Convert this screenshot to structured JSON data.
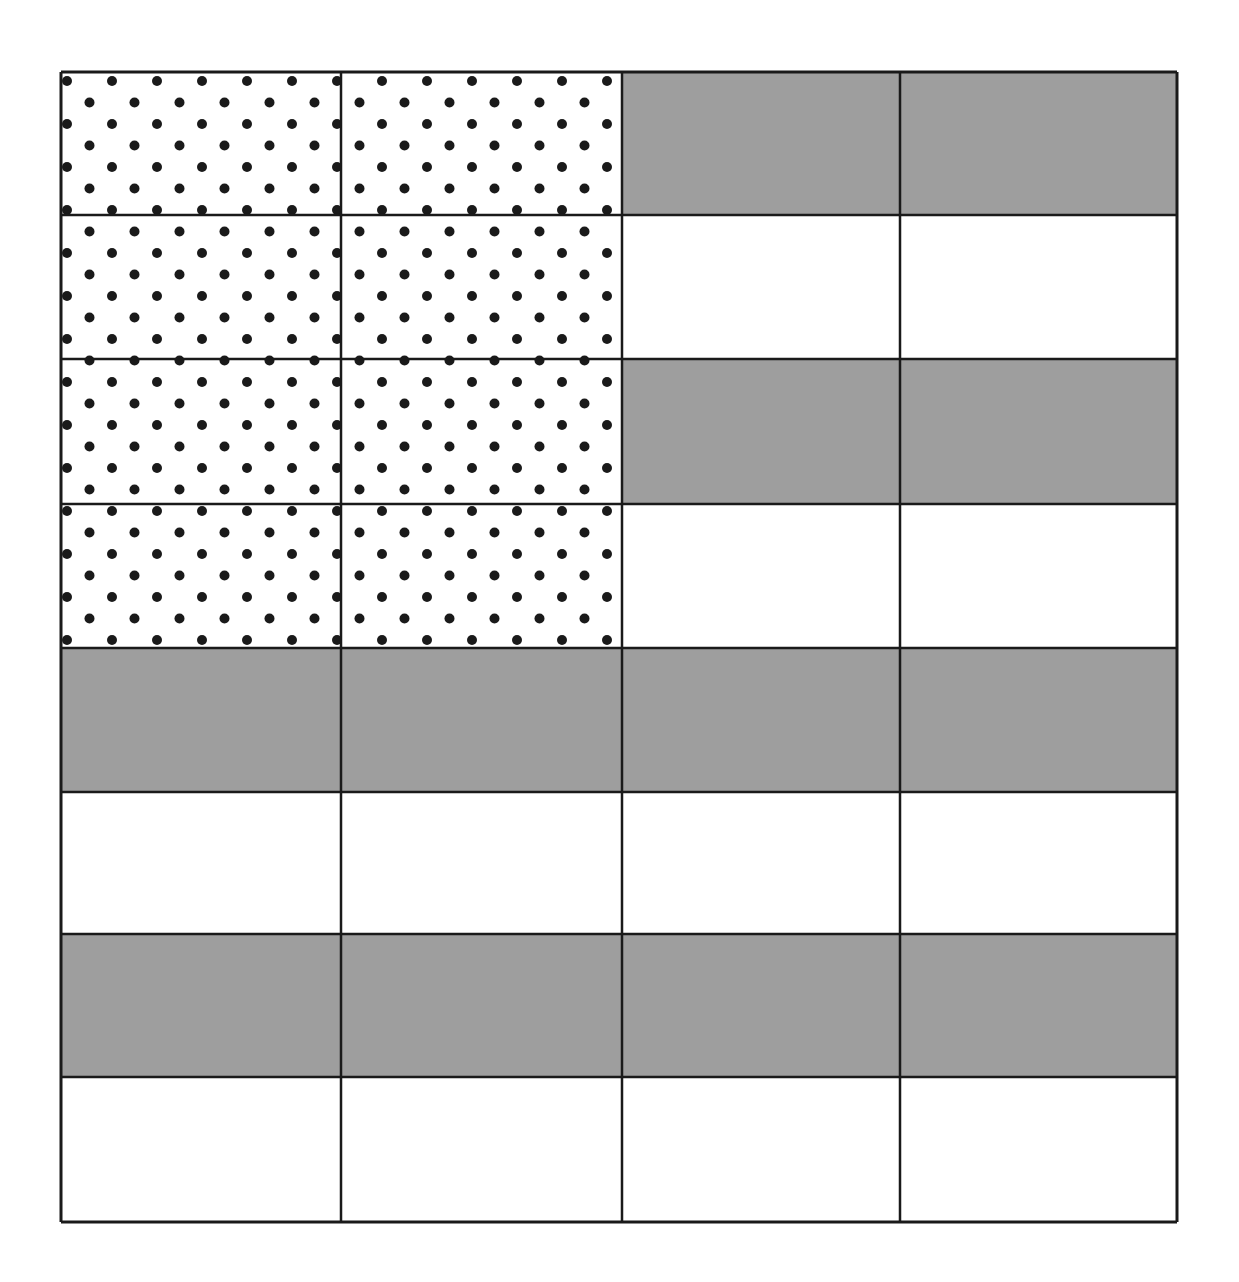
{
  "diagram": {
    "columns": 4,
    "rows": 8,
    "col_edges": [
      61,
      341,
      622,
      900,
      1177
    ],
    "row_edges": [
      72,
      215,
      359,
      504,
      648,
      792,
      934,
      1077,
      1222
    ],
    "colors": {
      "gray": "#9e9e9e",
      "white": "#ffffff",
      "line": "#1a1a1a",
      "dot": "#1a1a1a"
    },
    "canton": {
      "col_span": [
        0,
        2
      ],
      "row_span": [
        0,
        4
      ],
      "pattern": "staggered-dots",
      "dot_spacing_x": 45,
      "dot_row_spacing": 21.5,
      "dot_radius": 5
    },
    "stripes": [
      "gray",
      "white",
      "gray",
      "white",
      "gray",
      "white",
      "gray",
      "white"
    ]
  }
}
